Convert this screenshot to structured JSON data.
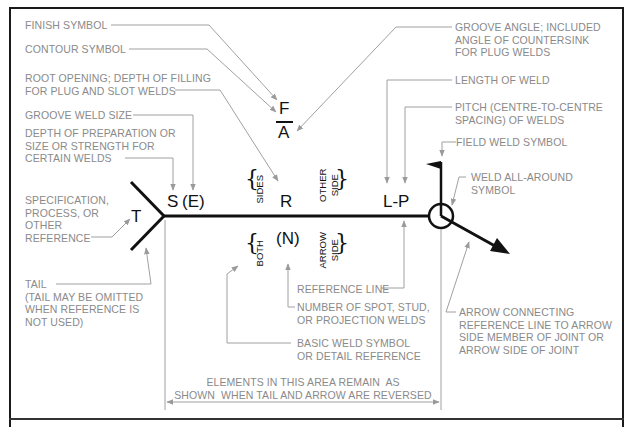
{
  "diagram": {
    "colors": {
      "symbol_line": "#111111",
      "leader_line": "#a0a0a0",
      "label_text": "#8a8a8a",
      "frame": "#1a1a1a"
    },
    "symbols": {
      "finish": "F",
      "groove_angle": "A",
      "depth": "S",
      "groove_size": "(E)",
      "root": "R",
      "tail_reference": "T",
      "length_pitch": "L-P",
      "number": "(N)"
    },
    "side_labels": {
      "sides": "SIDES",
      "other_side_1": "OTHER",
      "other_side_2": "SIDE",
      "both": "BOTH",
      "arrow_side_1": "ARROW",
      "arrow_side_2": "SIDE"
    },
    "labels": {
      "finish_symbol": "FINISH SYMBOL",
      "contour_symbol": "CONTOUR SYMBOL",
      "root_opening": "ROOT OPENING; DEPTH OF FILLING\nFOR PLUG AND SLOT WELDS",
      "groove_weld_size": "GROOVE WELD SIZE",
      "depth_of_preparation": "DEPTH OF PREPARATION OR\nSIZE OR STRENGTH FOR\nCERTAIN WELDS",
      "specification": "SPECIFICATION,\nPROCESS, OR\nOTHER\nREFERENCE",
      "tail": "TAIL\n(TAIL MAY BE OMITTED\nWHEN REFERENCE IS\nNOT USED)",
      "groove_angle": "GROOVE ANGLE; INCLUDED\nANGLE OF COUNTERSINK\nFOR PLUG WELDS",
      "length_of_weld": "LENGTH OF WELD",
      "pitch": "PITCH (CENTRE-TO-CENTRE\nSPACING) OF WELDS",
      "field_weld": "FIELD WELD SYMBOL",
      "weld_all_around": "WELD ALL-AROUND\nSYMBOL",
      "reference_line": "REFERENCE LINE",
      "number_of_welds": "NUMBER OF SPOT, STUD,\nOR PROJECTION WELDS",
      "basic_weld_symbol": "BASIC WELD SYMBOL\nOR DETAIL REFERENCE",
      "arrow_connecting": "ARROW CONNECTING\nREFERENCE LINE TO ARROW\nSIDE MEMBER OF JOINT OR\nARROW SIDE OF JOINT",
      "elements_area": "ELEMENTS IN THIS AREA REMAIN  AS\nSHOWN  WHEN TAIL AND ARROW ARE REVERSED"
    }
  }
}
